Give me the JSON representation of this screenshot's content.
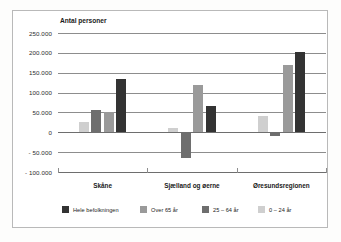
{
  "chart_data": {
    "type": "bar",
    "title": "",
    "ylabel": "Antal personer",
    "xlabel": "",
    "ylim": [
      -100000,
      250000
    ],
    "ytick_labels": [
      "250.000",
      "200.000",
      "150.000",
      "100.000",
      "50.000",
      "0",
      "- 50.000",
      "- 100.000"
    ],
    "ytick_values": [
      250000,
      200000,
      150000,
      100000,
      50000,
      0,
      -50000,
      -100000
    ],
    "grid": true,
    "legend_position": "bottom",
    "categories": [
      "Skåne",
      "Sjælland og øerne",
      "Øresundsregionen"
    ],
    "series": [
      {
        "name": "0 – 24 år",
        "color": "#cfcfcf",
        "values": [
          27000,
          11000,
          40000
        ]
      },
      {
        "name": "25 – 64 år",
        "color": "#6e6e6e",
        "values": [
          56000,
          -65000,
          -9000
        ]
      },
      {
        "name": "Over 65 år",
        "color": "#9a9a9a",
        "values": [
          50000,
          118000,
          169000
        ]
      },
      {
        "name": "Hele befolkningen",
        "color": "#333333",
        "values": [
          135000,
          67000,
          201000
        ]
      }
    ],
    "legend_order": [
      "Hele befolkningen",
      "Over 65 år",
      "25 – 64 år",
      "0 – 24 år"
    ]
  }
}
